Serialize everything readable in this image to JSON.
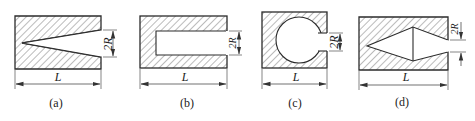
{
  "figure": {
    "panels": [
      {
        "id": "a",
        "caption": "(a)",
        "shape": "V-notch (wedge) crack",
        "length_label": "L",
        "opening_label": "2R"
      },
      {
        "id": "b",
        "caption": "(b)",
        "shape": "rectangular slot",
        "length_label": "L",
        "opening_label": "2R"
      },
      {
        "id": "c",
        "caption": "(c)",
        "shape": "circular hole with slit opening",
        "length_label": "L",
        "opening_label": "2R"
      },
      {
        "id": "d",
        "caption": "(d)",
        "shape": "diamond (double-wedge) cavity",
        "length_label": "L",
        "opening_label": "2R"
      }
    ],
    "colors": {
      "line": "#2b2b2b",
      "hatch": "#555555",
      "background": "#ffffff"
    }
  }
}
